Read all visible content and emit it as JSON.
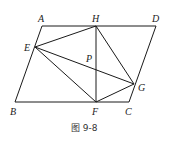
{
  "figure": {
    "caption": "图 9-8",
    "points": {
      "A": {
        "label": "A",
        "x": 42,
        "y": 26
      },
      "H": {
        "label": "H",
        "x": 96,
        "y": 26
      },
      "D": {
        "label": "D",
        "x": 156,
        "y": 26
      },
      "E": {
        "label": "E",
        "x": 35,
        "y": 47
      },
      "P": {
        "label": "P",
        "x": 96,
        "y": 69
      },
      "G": {
        "label": "G",
        "x": 134,
        "y": 84
      },
      "B": {
        "label": "B",
        "x": 15,
        "y": 102
      },
      "F": {
        "label": "F",
        "x": 96,
        "y": 102
      },
      "C": {
        "label": "C",
        "x": 129,
        "y": 102
      }
    },
    "segments": [
      "AD",
      "DC",
      "CB",
      "BA",
      "EH",
      "EF",
      "EG",
      "HF",
      "HG",
      "FG"
    ]
  }
}
